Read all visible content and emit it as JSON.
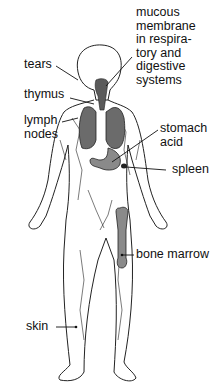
{
  "diagram": {
    "labels": {
      "mucous": [
        "mucous",
        "membrane",
        "in respira-",
        "tory and",
        "digestive",
        "systems"
      ],
      "tears": "tears",
      "thymus": "thymus",
      "lymph": [
        "lymph",
        "nodes"
      ],
      "stomach": [
        "stomach",
        "acid"
      ],
      "spleen": "spleen",
      "bone_marrow": "bone marrow",
      "skin": "skin"
    },
    "colors": {
      "organ_fill": "#6b6b6b",
      "outline": "#222222",
      "bone_fill": "#8a8a8a"
    }
  }
}
